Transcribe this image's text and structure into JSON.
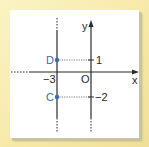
{
  "diagram": {
    "type": "coordinate-plane",
    "axes": {
      "x_label": "x",
      "y_label": "y",
      "origin_label": "O"
    },
    "vertical_line": {
      "x": -3,
      "label": "-3"
    },
    "points": [
      {
        "name": "D",
        "x": -3,
        "y": 1
      },
      {
        "name": "C",
        "x": -3,
        "y": -2
      }
    ],
    "y_ticks": [
      {
        "value": 1,
        "label": "1"
      },
      {
        "value": -2,
        "label": "−2"
      }
    ],
    "x_tick_label": "−3",
    "colors": {
      "point": "#3d6aa8",
      "axis": "#2a2a2a",
      "frame": "#f7eaa8",
      "card": "#ffffff"
    }
  }
}
